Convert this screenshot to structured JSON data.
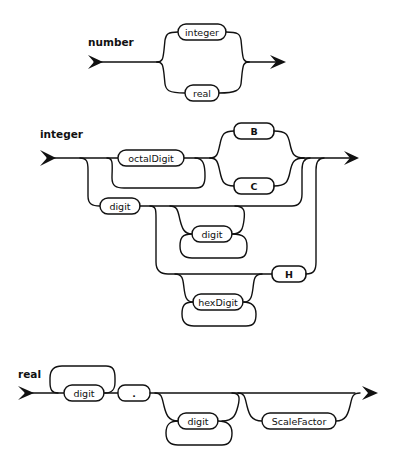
{
  "diagrams": {
    "number": {
      "title": "number",
      "alternatives": [
        "integer",
        "real"
      ]
    },
    "integer": {
      "title": "integer",
      "terms": {
        "octalDigit": "octalDigit",
        "B": "B",
        "C": "C",
        "digit_first": "digit",
        "digit_repeat": "digit",
        "H": "H",
        "hexDigit": "hexDigit"
      }
    },
    "real": {
      "title": "real",
      "terms": {
        "digit_first": "digit",
        "dot": ".",
        "digit_after": "digit",
        "scale": "ScaleFactor"
      }
    }
  }
}
